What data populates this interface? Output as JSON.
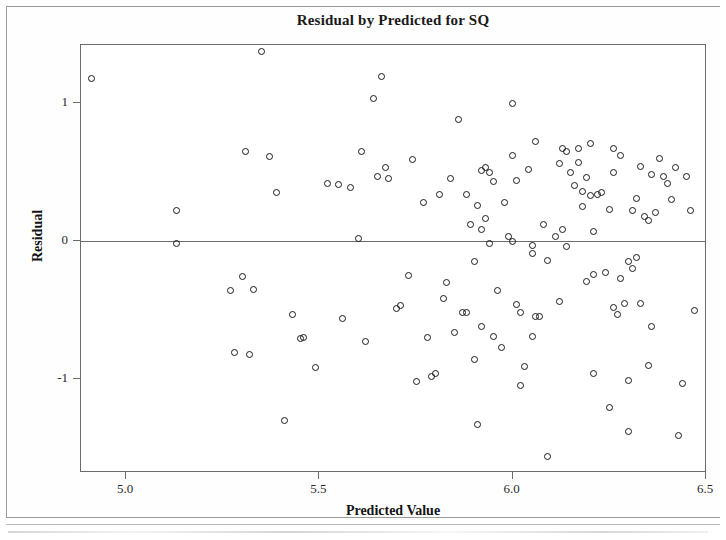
{
  "chart_data": {
    "type": "scatter",
    "title": "Residual by Predicted for SQ",
    "xlabel": "Predicted Value",
    "ylabel": "Residual",
    "xlim": [
      4.87,
      6.5
    ],
    "ylim": [
      -1.6,
      1.45
    ],
    "grid": false,
    "legend": null,
    "xticks": [
      5.0,
      5.5,
      6.0,
      6.5
    ],
    "xticklabels": [
      "5.0",
      "5.5",
      "6.0",
      "6.5"
    ],
    "yticks": [
      1,
      0,
      -1
    ],
    "yticklabels": [
      "1",
      "0",
      "-1"
    ],
    "reference_lines": [
      {
        "axis": "y",
        "value": 0
      }
    ],
    "marker": "open-circle",
    "marker_color": "#1b1b1b",
    "n_points": 140,
    "points": [
      [
        4.91,
        1.18
      ],
      [
        5.13,
        -0.02
      ],
      [
        5.13,
        0.22
      ],
      [
        5.27,
        -0.36
      ],
      [
        5.28,
        -0.81
      ],
      [
        5.3,
        -0.26
      ],
      [
        5.31,
        0.65
      ],
      [
        5.32,
        -0.82
      ],
      [
        5.33,
        -0.35
      ],
      [
        5.35,
        1.37
      ],
      [
        5.37,
        0.61
      ],
      [
        5.39,
        0.35
      ],
      [
        5.41,
        -1.3
      ],
      [
        5.43,
        -0.53
      ],
      [
        5.45,
        -0.71
      ],
      [
        5.46,
        -0.7
      ],
      [
        5.49,
        -0.92
      ],
      [
        5.52,
        0.42
      ],
      [
        5.55,
        0.41
      ],
      [
        5.56,
        -0.56
      ],
      [
        5.58,
        0.39
      ],
      [
        5.6,
        0.02
      ],
      [
        5.61,
        0.65
      ],
      [
        5.62,
        -0.73
      ],
      [
        5.64,
        1.03
      ],
      [
        5.65,
        0.47
      ],
      [
        5.66,
        1.19
      ],
      [
        5.67,
        0.53
      ],
      [
        5.68,
        0.45
      ],
      [
        5.7,
        -0.49
      ],
      [
        5.71,
        -0.47
      ],
      [
        5.73,
        -0.25
      ],
      [
        5.74,
        0.59
      ],
      [
        5.75,
        -1.02
      ],
      [
        5.77,
        0.28
      ],
      [
        5.78,
        -0.7
      ],
      [
        5.79,
        -0.98
      ],
      [
        5.8,
        -0.96
      ],
      [
        5.81,
        0.34
      ],
      [
        5.82,
        -0.42
      ],
      [
        5.83,
        -0.3
      ],
      [
        5.84,
        0.45
      ],
      [
        5.85,
        -0.66
      ],
      [
        5.86,
        0.88
      ],
      [
        5.87,
        -0.52
      ],
      [
        5.88,
        -0.52
      ],
      [
        5.88,
        0.34
      ],
      [
        5.89,
        0.12
      ],
      [
        5.9,
        -0.86
      ],
      [
        5.9,
        -0.15
      ],
      [
        5.91,
        0.26
      ],
      [
        5.91,
        -1.33
      ],
      [
        5.92,
        0.51
      ],
      [
        5.92,
        0.08
      ],
      [
        5.92,
        -0.62
      ],
      [
        5.93,
        0.53
      ],
      [
        5.93,
        0.16
      ],
      [
        5.94,
        0.5
      ],
      [
        5.95,
        -0.69
      ],
      [
        5.95,
        0.43
      ],
      [
        5.96,
        -0.36
      ],
      [
        5.97,
        -0.77
      ],
      [
        5.98,
        0.28
      ],
      [
        5.99,
        0.03
      ],
      [
        6.0,
        0.62
      ],
      [
        6.0,
        1.0
      ],
      [
        6.0,
        0.0
      ],
      [
        6.01,
        0.44
      ],
      [
        6.01,
        -0.46
      ],
      [
        6.02,
        -0.52
      ],
      [
        6.02,
        -1.05
      ],
      [
        6.03,
        -0.91
      ],
      [
        6.04,
        0.52
      ],
      [
        6.05,
        -0.09
      ],
      [
        6.05,
        -0.03
      ],
      [
        6.06,
        0.72
      ],
      [
        6.06,
        -0.55
      ],
      [
        6.07,
        -0.55
      ],
      [
        6.08,
        0.12
      ],
      [
        6.09,
        -0.14
      ],
      [
        6.09,
        -1.56
      ],
      [
        6.11,
        0.03
      ],
      [
        6.12,
        0.56
      ],
      [
        6.12,
        -0.44
      ],
      [
        6.13,
        0.67
      ],
      [
        6.13,
        0.08
      ],
      [
        6.14,
        0.65
      ],
      [
        6.14,
        -0.04
      ],
      [
        6.15,
        0.5
      ],
      [
        6.16,
        0.4
      ],
      [
        6.17,
        0.67
      ],
      [
        6.17,
        0.57
      ],
      [
        6.18,
        0.36
      ],
      [
        6.18,
        0.25
      ],
      [
        6.19,
        -0.29
      ],
      [
        6.2,
        0.71
      ],
      [
        6.2,
        0.33
      ],
      [
        6.21,
        -0.24
      ],
      [
        6.21,
        -0.96
      ],
      [
        6.22,
        0.34
      ],
      [
        6.23,
        0.35
      ],
      [
        6.24,
        -0.23
      ],
      [
        6.25,
        0.23
      ],
      [
        6.25,
        -1.21
      ],
      [
        6.26,
        0.67
      ],
      [
        6.26,
        0.5
      ],
      [
        6.26,
        -0.48
      ],
      [
        6.27,
        -0.53
      ],
      [
        6.28,
        -0.27
      ],
      [
        6.28,
        0.62
      ],
      [
        6.29,
        -0.45
      ],
      [
        6.3,
        -0.15
      ],
      [
        6.3,
        -1.01
      ],
      [
        6.3,
        -1.38
      ],
      [
        6.31,
        0.22
      ],
      [
        6.31,
        -0.2
      ],
      [
        6.32,
        0.31
      ],
      [
        6.32,
        -0.12
      ],
      [
        6.33,
        0.54
      ],
      [
        6.33,
        -0.45
      ],
      [
        6.34,
        0.18
      ],
      [
        6.35,
        0.15
      ],
      [
        6.35,
        -0.9
      ],
      [
        6.36,
        0.48
      ],
      [
        6.37,
        0.21
      ],
      [
        6.38,
        0.6
      ],
      [
        6.39,
        0.47
      ],
      [
        6.4,
        0.42
      ],
      [
        6.41,
        0.3
      ],
      [
        6.42,
        0.53
      ],
      [
        6.43,
        -1.41
      ],
      [
        6.44,
        -1.03
      ],
      [
        6.45,
        0.47
      ],
      [
        6.46,
        0.22
      ],
      [
        6.47,
        -0.5
      ],
      [
        6.05,
        -0.69
      ],
      [
        6.19,
        0.46
      ],
      [
        5.94,
        -0.02
      ],
      [
        6.21,
        0.07
      ],
      [
        6.36,
        -0.62
      ]
    ]
  },
  "chart": {
    "title": "Residual by Predicted for SQ",
    "x_axis_title": "Predicted Value",
    "y_axis_title": "Residual",
    "x_tick_labels": [
      "5.0",
      "5.5",
      "6.0",
      "6.5"
    ],
    "y_tick_labels": [
      "1",
      "0",
      "-1"
    ]
  }
}
